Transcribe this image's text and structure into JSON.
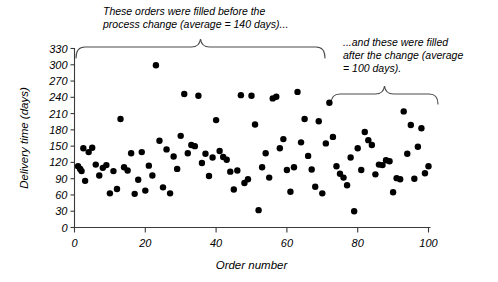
{
  "annotations": {
    "before": "These orders were filled before the\nprocess change (average = 140 days)...",
    "after": "...and these were filled\nafter the change (average\n= 100 days)."
  },
  "chart_data": {
    "type": "scatter",
    "title": "",
    "xlabel": "Order number",
    "ylabel": "Delivery time (days)",
    "xlim": [
      0,
      100
    ],
    "ylim": [
      0,
      330
    ],
    "xticks": [
      0,
      20,
      40,
      60,
      80,
      100
    ],
    "yticks": [
      0,
      30,
      60,
      90,
      120,
      150,
      180,
      210,
      240,
      270,
      300,
      330
    ],
    "grid": false,
    "legend": null,
    "marker": "filled-circle",
    "marker_color": "#000000",
    "marker_size": 3.2,
    "points": [
      [
        1,
        113
      ],
      [
        1.6,
        108
      ],
      [
        2,
        104
      ],
      [
        2.5,
        146
      ],
      [
        3,
        86
      ],
      [
        4,
        139
      ],
      [
        5,
        147
      ],
      [
        6,
        116
      ],
      [
        7,
        96
      ],
      [
        8,
        110
      ],
      [
        9,
        115
      ],
      [
        10,
        63
      ],
      [
        11,
        104
      ],
      [
        12,
        71
      ],
      [
        13,
        200
      ],
      [
        14,
        111
      ],
      [
        15,
        105
      ],
      [
        16,
        137
      ],
      [
        17,
        62
      ],
      [
        18,
        88
      ],
      [
        19,
        139
      ],
      [
        20,
        68
      ],
      [
        21,
        114
      ],
      [
        22,
        96
      ],
      [
        23,
        299
      ],
      [
        24,
        160
      ],
      [
        25,
        74
      ],
      [
        26,
        144
      ],
      [
        27,
        63
      ],
      [
        28,
        131
      ],
      [
        29,
        108
      ],
      [
        30,
        169
      ],
      [
        31,
        246
      ],
      [
        32,
        137
      ],
      [
        33,
        152
      ],
      [
        34,
        150
      ],
      [
        35,
        243
      ],
      [
        36,
        119
      ],
      [
        37,
        136
      ],
      [
        38,
        95
      ],
      [
        39,
        129
      ],
      [
        40,
        198
      ],
      [
        41,
        141
      ],
      [
        42,
        130
      ],
      [
        43,
        125
      ],
      [
        44,
        103
      ],
      [
        45,
        70
      ],
      [
        46,
        105
      ],
      [
        47,
        244
      ],
      [
        48,
        82
      ],
      [
        49,
        89
      ],
      [
        50,
        243
      ],
      [
        51,
        190
      ],
      [
        52,
        32
      ],
      [
        53,
        111
      ],
      [
        54,
        137
      ],
      [
        55,
        92
      ],
      [
        56,
        238
      ],
      [
        57,
        241
      ],
      [
        58,
        146
      ],
      [
        59,
        163
      ],
      [
        60,
        106
      ],
      [
        61,
        66
      ],
      [
        62,
        111
      ],
      [
        63,
        250
      ],
      [
        64,
        157
      ],
      [
        65,
        200
      ],
      [
        66,
        132
      ],
      [
        67,
        107
      ],
      [
        68,
        75
      ],
      [
        69,
        196
      ],
      [
        70,
        63
      ],
      [
        71,
        155
      ],
      [
        72,
        230
      ],
      [
        73,
        167
      ],
      [
        74,
        113
      ],
      [
        75,
        99
      ],
      [
        76,
        92
      ],
      [
        77,
        78
      ],
      [
        78,
        129
      ],
      [
        79,
        30
      ],
      [
        80,
        146
      ],
      [
        81,
        106
      ],
      [
        82,
        176
      ],
      [
        83,
        161
      ],
      [
        84,
        152
      ],
      [
        85,
        98
      ],
      [
        86,
        116
      ],
      [
        87,
        115
      ],
      [
        88,
        124
      ],
      [
        89,
        122
      ],
      [
        90,
        65
      ],
      [
        91,
        91
      ],
      [
        92,
        89
      ],
      [
        93,
        214
      ],
      [
        94,
        136
      ],
      [
        95,
        189
      ],
      [
        96,
        90
      ],
      [
        97,
        149
      ],
      [
        98,
        183
      ],
      [
        99,
        100
      ],
      [
        100,
        113
      ]
    ],
    "group_braces": [
      {
        "name": "before-change",
        "x_start": 0.5,
        "x_end": 71,
        "label_ref": "before"
      },
      {
        "name": "after-change",
        "x_start": 73,
        "x_end": 103,
        "label_ref": "after"
      }
    ]
  }
}
